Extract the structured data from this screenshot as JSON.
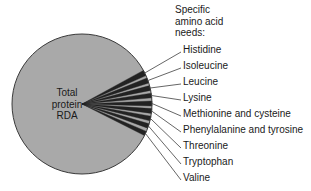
{
  "figure": {
    "name": "protein-rda-amino-acid-pie-chart",
    "background_color": "#ffffff"
  },
  "center_label": {
    "line1": "Total",
    "line2": "protein",
    "line3": "RDA"
  },
  "legend_heading": {
    "line1": "Specific",
    "line2": "amino acid",
    "line3": "needs:"
  },
  "colors": {
    "main_slice_fill": "#a9a9a9",
    "amino_slice_fill": "#222222",
    "outline": "#3a3a3a",
    "leader_line": "#555555",
    "text": "#1a1a1a"
  },
  "chart_data": {
    "type": "pie",
    "title": "",
    "subtitle": "",
    "legend_position": "right",
    "grid": false,
    "center_text": "Total protein RDA",
    "legend_title": "Specific amino acid needs:",
    "categories": [
      "Total protein RDA",
      "Histidine",
      "Isoleucine",
      "Leucine",
      "Lysine",
      "Methionine and cysteine",
      "Phenylalanine and tyrosine",
      "Threonine",
      "Tryptophan",
      "Valine"
    ],
    "values": [
      91.0,
      1.0,
      1.0,
      1.0,
      1.0,
      1.0,
      1.0,
      1.0,
      1.0,
      1.0
    ],
    "unit": "percent of total",
    "annotations": [
      "Total protein RDA occupies the overwhelming majority of the circle",
      "Nine individual essential amino acid needs form thin wedges on the right side"
    ]
  },
  "slices": [
    {
      "label": "Histidine",
      "label_y": 44,
      "edge_y": 73.0,
      "wedge_top": 70.4,
      "wedge_bottom": 75.6
    },
    {
      "label": "Isoleucine",
      "label_y": 60,
      "edge_y": 80.5,
      "wedge_top": 78.0,
      "wedge_bottom": 83.0
    },
    {
      "label": "Leucine",
      "label_y": 76,
      "edge_y": 88.0,
      "wedge_top": 85.6,
      "wedge_bottom": 90.4
    },
    {
      "label": "Lysine",
      "label_y": 92,
      "edge_y": 95.5,
      "wedge_top": 93.2,
      "wedge_bottom": 97.8
    },
    {
      "label": "Methionine and cysteine",
      "label_y": 108,
      "edge_y": 103.5,
      "wedge_top": 101.0,
      "wedge_bottom": 106.0
    },
    {
      "label": "Phenylalanine and tyrosine",
      "label_y": 124,
      "edge_y": 111.0,
      "wedge_top": 108.6,
      "wedge_bottom": 113.4
    },
    {
      "label": "Threonine",
      "label_y": 140,
      "edge_y": 118.5,
      "wedge_top": 116.2,
      "wedge_bottom": 120.8
    },
    {
      "label": "Tryptophan",
      "label_y": 156,
      "edge_y": 126.0,
      "wedge_top": 123.8,
      "wedge_bottom": 128.2
    },
    {
      "label": "Valine",
      "label_y": 172,
      "edge_y": 133.5,
      "wedge_top": 131.4,
      "wedge_bottom": 135.6
    }
  ]
}
